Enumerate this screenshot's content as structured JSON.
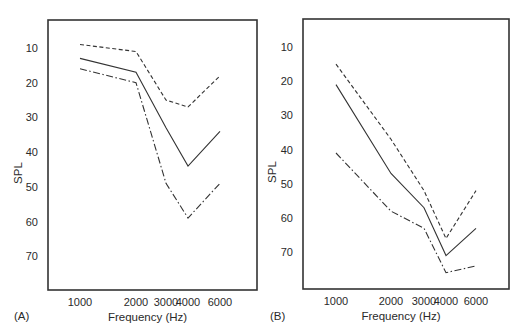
{
  "chart_data": [
    {
      "panel": "(A)",
      "type": "line",
      "xlabel": "Frequency (Hz)",
      "ylabel": "SPL",
      "x": [
        "1000",
        "2000",
        "3000",
        "4000",
        "6000"
      ],
      "yticks": [
        "10",
        "20",
        "30",
        "40",
        "50",
        "60",
        "70"
      ],
      "ylim": [
        2,
        78
      ],
      "y_inverted": true,
      "grid": false,
      "series": [
        {
          "name": "dashed",
          "style": "dashed",
          "values": [
            9,
            11,
            25,
            27,
            18
          ]
        },
        {
          "name": "solid",
          "style": "solid",
          "values": [
            13,
            17,
            33,
            44,
            34
          ]
        },
        {
          "name": "dash-dot",
          "style": "dashdot",
          "values": [
            16,
            20,
            49,
            59,
            49
          ]
        }
      ]
    },
    {
      "panel": "(B)",
      "type": "line",
      "xlabel": "Frequency (Hz)",
      "ylabel": "SPL",
      "x": [
        "1000",
        "2000",
        "3000",
        "4000",
        "6000"
      ],
      "yticks": [
        "10",
        "20",
        "30",
        "40",
        "50",
        "60",
        "70"
      ],
      "ylim": [
        2,
        78
      ],
      "y_inverted": true,
      "grid": false,
      "series": [
        {
          "name": "dashed",
          "style": "dashed",
          "values": [
            15,
            37,
            52,
            66,
            52
          ]
        },
        {
          "name": "solid",
          "style": "solid",
          "values": [
            21,
            47,
            57,
            71,
            63
          ]
        },
        {
          "name": "dash-dot",
          "style": "dashdot",
          "values": [
            41,
            58,
            63,
            76,
            74
          ]
        }
      ]
    }
  ],
  "panels": [
    {
      "label": "(A)",
      "xlabel": "Frequency (Hz)",
      "ylabel": "SPL"
    },
    {
      "label": "(B)",
      "xlabel": "Frequency (Hz)",
      "ylabel": "SPL"
    }
  ]
}
